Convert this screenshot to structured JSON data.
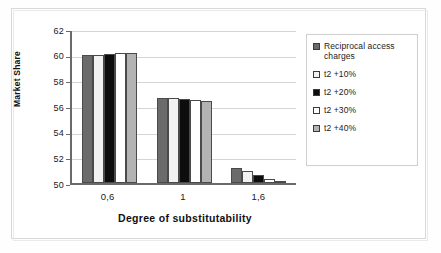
{
  "chart_data": {
    "type": "bar",
    "title": "",
    "xlabel": "Degree of substitutability",
    "ylabel": "Market Share",
    "categories": [
      "0,6",
      "1",
      "1,6"
    ],
    "ylim": [
      50,
      62
    ],
    "yticks": [
      "50",
      "52",
      "54",
      "56",
      "58",
      "60",
      "62"
    ],
    "grid": true,
    "legend_position": "right",
    "series": [
      {
        "name": "Reciprocal access charges",
        "color": "#6b6b6b",
        "values": [
          59.95,
          56.65,
          51.2
        ]
      },
      {
        "name": "t2 +10%",
        "color": "#f2f2f2",
        "values": [
          60.0,
          56.6,
          50.9
        ]
      },
      {
        "name": "t2 +20%",
        "color": "#0d0d0d",
        "values": [
          60.05,
          56.55,
          50.6
        ]
      },
      {
        "name": "t2 +30%",
        "color": "#ffffff",
        "values": [
          60.1,
          56.5,
          50.35
        ]
      },
      {
        "name": "t2 +40%",
        "color": "#b3b3b3",
        "values": [
          60.15,
          56.4,
          50.1
        ]
      }
    ]
  },
  "axes": {
    "y_title": "Market Share",
    "x_title": "Degree of substitutability"
  }
}
